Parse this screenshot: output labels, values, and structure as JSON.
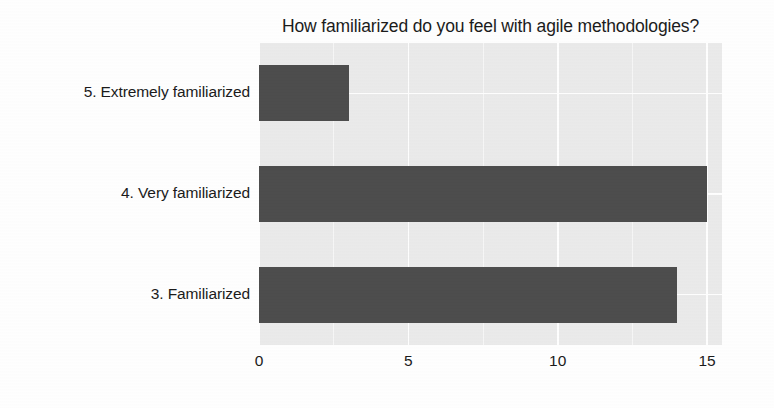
{
  "chart_data": {
    "type": "bar",
    "orientation": "horizontal",
    "title": "How familiarized do you feel with agile methodologies?",
    "xlabel": "",
    "ylabel": "",
    "categories": [
      "5. Extremely familiarized",
      "4. Very familiarized",
      "3. Familiarized"
    ],
    "values": [
      3,
      15,
      14
    ],
    "xlim": [
      0,
      15.5
    ],
    "xticks": [
      0,
      5,
      10,
      15
    ],
    "xtick_labels": [
      "0",
      "5",
      "10",
      "15"
    ],
    "grid": true,
    "legend": "none",
    "colors": {
      "bar": "#4d4d4d",
      "panel_background": "#ebebeb",
      "gridline": "#ffffff",
      "text": "#1b1b1b",
      "figure_background": "#ffffff"
    }
  }
}
